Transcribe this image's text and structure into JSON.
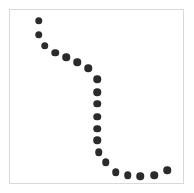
{
  "figure": {
    "background_color": "#ffffff",
    "frame_color": "#d9d9d9",
    "frame_left": 9,
    "frame_top": 9,
    "frame_width": 175,
    "frame_height": 175
  },
  "chart_data": {
    "type": "scatter",
    "title": "",
    "subtitle": "",
    "xlabel": "",
    "ylabel": "",
    "xlim": [
      0,
      100
    ],
    "ylim": [
      0,
      100
    ],
    "grid": false,
    "legend": [],
    "legend_position": "none",
    "annotations": [],
    "xticks": [],
    "yticks": [],
    "xticklabels": [],
    "yticklabels": [],
    "marker": {
      "shape": "circle",
      "color": "#2b2b2b",
      "size_px": 7.5,
      "edge_color": "#2b2b2b"
    },
    "series": [
      {
        "name": "series-1",
        "color": "#2b2b2b",
        "points": [
          {
            "x": 16.6,
            "y": 93.7
          },
          {
            "x": 16.6,
            "y": 85.7
          },
          {
            "x": 20.0,
            "y": 79.4
          },
          {
            "x": 26.3,
            "y": 75.4
          },
          {
            "x": 32.6,
            "y": 72.6
          },
          {
            "x": 38.9,
            "y": 69.7
          },
          {
            "x": 45.1,
            "y": 66.3
          },
          {
            "x": 50.3,
            "y": 60.0
          },
          {
            "x": 50.3,
            "y": 52.6
          },
          {
            "x": 50.3,
            "y": 45.7
          },
          {
            "x": 50.3,
            "y": 38.3
          },
          {
            "x": 50.3,
            "y": 31.4
          },
          {
            "x": 50.3,
            "y": 24.6
          },
          {
            "x": 51.4,
            "y": 17.7
          },
          {
            "x": 55.4,
            "y": 12.0
          },
          {
            "x": 61.1,
            "y": 6.3
          },
          {
            "x": 68.0,
            "y": 4.6
          },
          {
            "x": 75.4,
            "y": 4.0
          },
          {
            "x": 83.4,
            "y": 4.6
          },
          {
            "x": 90.9,
            "y": 7.4
          }
        ]
      }
    ]
  }
}
